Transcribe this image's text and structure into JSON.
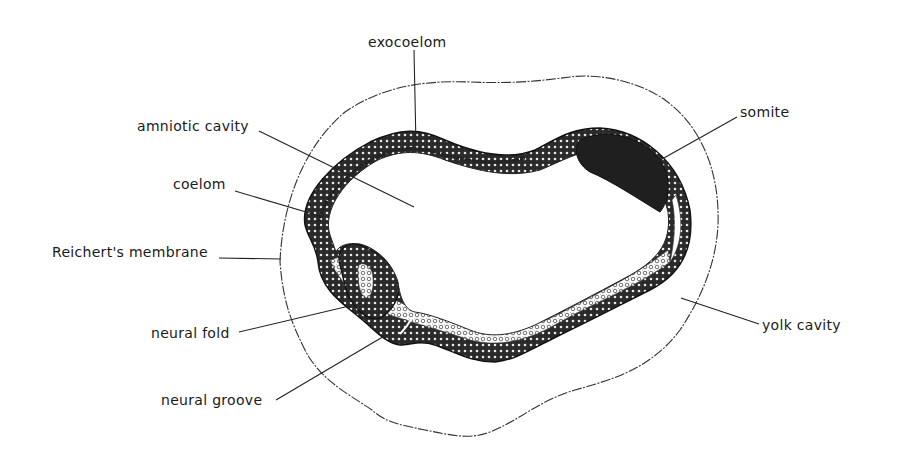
{
  "figure": {
    "ink_color": "#1a1a1a",
    "background": "#ffffff"
  },
  "labels": [
    {
      "id": "exocoelom",
      "text": "exocoelom",
      "x": 368,
      "y": 35,
      "line": [
        414,
        50,
        416,
        146
      ]
    },
    {
      "id": "amniotic-cavity",
      "text": "amniotic cavity",
      "x": 137,
      "y": 119,
      "line": [
        259,
        131,
        414,
        207
      ]
    },
    {
      "id": "coelom",
      "text": "coelom",
      "x": 173,
      "y": 177,
      "line": [
        235,
        191,
        323,
        217
      ]
    },
    {
      "id": "reicherts-membrane",
      "text": "Reichert's membrane",
      "x": 52,
      "y": 245,
      "line": [
        219,
        258,
        281,
        259
      ]
    },
    {
      "id": "neural-fold",
      "text": "neural fold",
      "x": 151,
      "y": 326,
      "line": [
        239,
        332,
        362,
        303
      ]
    },
    {
      "id": "neural-groove",
      "text": "neural groove",
      "x": 161,
      "y": 393,
      "line": [
        276,
        400,
        386,
        335
      ]
    },
    {
      "id": "somite",
      "text": "somite",
      "x": 740,
      "y": 105,
      "line": [
        737,
        117,
        655,
        163
      ]
    },
    {
      "id": "yolk-cavity",
      "text": "yolk cavity",
      "x": 762,
      "y": 318,
      "line": [
        759,
        324,
        681,
        298
      ]
    }
  ]
}
